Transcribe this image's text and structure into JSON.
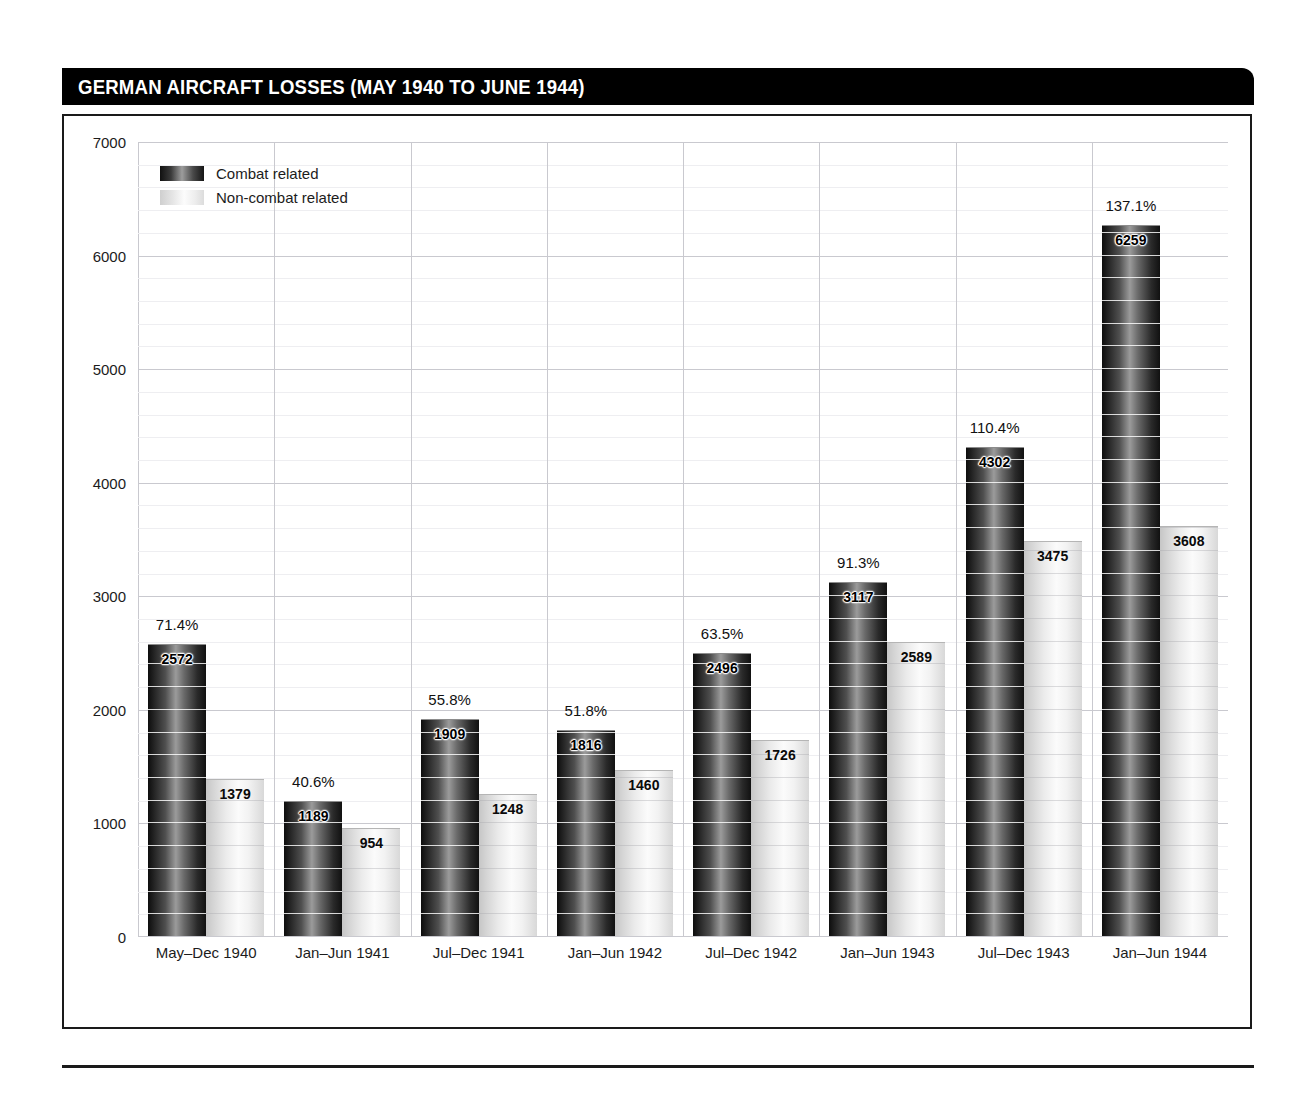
{
  "header": {
    "title": "GERMAN AIRCRAFT LOSSES (MAY 1940 TO JUNE 1944)"
  },
  "legend": {
    "position": "top-left",
    "items": [
      {
        "label": "Combat related",
        "swatch": "dark-gradient-swatch",
        "color": "#333333"
      },
      {
        "label": "Non-combat related",
        "swatch": "light-gradient-swatch",
        "color": "#e8e8e8"
      }
    ]
  },
  "chart_data": {
    "type": "bar",
    "title": "GERMAN AIRCRAFT LOSSES (MAY 1940 TO JUNE 1944)",
    "xlabel": "",
    "ylabel": "",
    "ylim": [
      0,
      7000
    ],
    "ytick_step": 1000,
    "yticks": [
      0,
      1000,
      2000,
      3000,
      4000,
      5000,
      6000,
      7000
    ],
    "ytick_labels": [
      "0",
      "1000",
      "2000",
      "3000",
      "4000",
      "5000",
      "6000",
      "7000"
    ],
    "minor_tick_step": 200,
    "grid": true,
    "legend_position": "top-left",
    "categories": [
      "May–Dec 1940",
      "Jan–Jun 1941",
      "Jul–Dec 1941",
      "Jan–Jun 1942",
      "Jul–Dec 1942",
      "Jan–Jun 1943",
      "Jul–Dec 1943",
      "Jan–Jun 1944"
    ],
    "series": [
      {
        "name": "Combat related",
        "values": [
          2572,
          1189,
          1909,
          1816,
          2496,
          3117,
          4302,
          6259
        ],
        "labels": [
          "2572",
          "1189",
          "1909",
          "1816",
          "2496",
          "3117",
          "4302",
          "6259"
        ]
      },
      {
        "name": "Non-combat related",
        "values": [
          1379,
          954,
          1248,
          1460,
          1726,
          2589,
          3475,
          3608
        ],
        "labels": [
          "1379",
          "954",
          "1248",
          "1460",
          "1726",
          "2589",
          "3475",
          "3608"
        ]
      }
    ],
    "annotations": {
      "name": "percent-of-strength-labels",
      "values": [
        "71.4%",
        "40.6%",
        "55.8%",
        "51.8%",
        "63.5%",
        "91.3%",
        "110.4%",
        "137.1%"
      ]
    }
  }
}
